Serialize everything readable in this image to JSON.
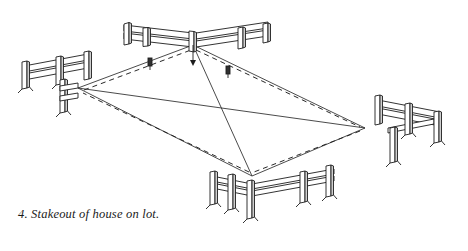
{
  "figure": {
    "caption": "4. Stakeout of house on lot.",
    "number": "4",
    "subject": "Stakeout of house on lot",
    "background_color": "#ffffff",
    "line_color": "#1d1d1d",
    "fill_color": "#ffffff",
    "shade_color": "#cfcfcf"
  },
  "drawing": {
    "type": "isometric-line-drawing",
    "description": "Four corner batter-board assemblies with string lines and dashed building outline",
    "corners": [
      {
        "id": "top",
        "label": "rear corner batter board",
        "x": 193,
        "y": 45
      },
      {
        "id": "left",
        "label": "left corner batter board",
        "x": 78,
        "y": 88
      },
      {
        "id": "right",
        "label": "right corner batter board",
        "x": 365,
        "y": 128
      },
      {
        "id": "bottom",
        "label": "front corner batter board",
        "x": 252,
        "y": 176
      }
    ],
    "building_outline": {
      "style": "dashed",
      "points": "78,88 193,45 365,128 252,176"
    },
    "string_lines": {
      "style": "solid",
      "pairs": [
        "top-left",
        "top-right",
        "top-bottom",
        "left-right",
        "left-bottom",
        "right-bottom"
      ]
    },
    "marker_stakes": [
      {
        "id": "stake-a",
        "x": 150,
        "y": 64
      },
      {
        "id": "stake-b",
        "x": 228,
        "y": 72
      }
    ]
  }
}
